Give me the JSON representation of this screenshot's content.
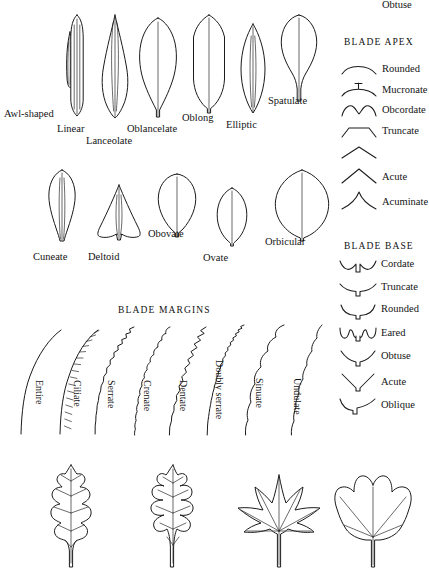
{
  "plate": {
    "title": "Leaf Morphology Plate",
    "background_color": "#ffffff",
    "ink_color": "#1b1b1b"
  },
  "blade_shapes_row1": {
    "items": [
      {
        "label": "Awl-shaped",
        "shape": "subulate"
      },
      {
        "label": "Linear",
        "shape": "linear"
      },
      {
        "label": "Lanceolate",
        "shape": "lanceolate"
      },
      {
        "label": "Oblancelate",
        "shape": "oblanceolate"
      },
      {
        "label": "Oblong",
        "shape": "oblong"
      },
      {
        "label": "Elliptic",
        "shape": "elliptic"
      },
      {
        "label": "Spatulate",
        "shape": "spatulate"
      }
    ]
  },
  "blade_shapes_row2": {
    "items": [
      {
        "label": "Cuneate",
        "shape": "cuneate"
      },
      {
        "label": "Deltoid",
        "shape": "deltoid"
      },
      {
        "label": "Obovate",
        "shape": "obovate"
      },
      {
        "label": "Ovate",
        "shape": "ovate"
      },
      {
        "label": "Orbicular",
        "shape": "orbicular"
      }
    ]
  },
  "blade_apex": {
    "heading": "BLADE APEX",
    "items": [
      {
        "label": "Rounded",
        "glyph": "apex-rounded"
      },
      {
        "label": "Mucronate",
        "glyph": "apex-mucronate"
      },
      {
        "label": "Obcordate",
        "glyph": "apex-obcordate"
      },
      {
        "label": "Truncate",
        "glyph": "apex-truncate"
      },
      {
        "label": "Obtuse",
        "glyph": "apex-obtuse"
      },
      {
        "label": "Acute",
        "glyph": "apex-acute"
      },
      {
        "label": "Acuminate",
        "glyph": "apex-acuminate"
      }
    ]
  },
  "blade_base": {
    "heading": "BLADE BASE",
    "items": [
      {
        "label": "Cordate",
        "glyph": "base-cordate"
      },
      {
        "label": "Truncate",
        "glyph": "base-truncate"
      },
      {
        "label": "Rounded",
        "glyph": "base-rounded"
      },
      {
        "label": "Eared",
        "glyph": "base-eared"
      },
      {
        "label": "Obtuse",
        "glyph": "base-obtuse"
      },
      {
        "label": "Acute",
        "glyph": "base-acute"
      },
      {
        "label": "Oblique",
        "glyph": "base-oblique"
      }
    ]
  },
  "blade_margins": {
    "heading": "BLADE MARGINS",
    "items": [
      {
        "label": "Entire",
        "margin": "entire"
      },
      {
        "label": "Ciliate",
        "margin": "ciliate"
      },
      {
        "label": "Serrate",
        "margin": "serrate"
      },
      {
        "label": "Crenate",
        "margin": "crenate"
      },
      {
        "label": "Dentate",
        "margin": "dentate"
      },
      {
        "label": "Doubly serrate",
        "margin": "doubly-serrate"
      },
      {
        "label": "Sinuate",
        "margin": "sinuate"
      },
      {
        "label": "Undulate",
        "margin": "undulate"
      }
    ]
  },
  "lobed_leaves": {
    "items": [
      {
        "shape": "pinnately-lobed-shallow"
      },
      {
        "shape": "pinnately-lobed-deep"
      },
      {
        "shape": "palmately-lobed-maple"
      },
      {
        "shape": "palmately-lobed-tulip"
      }
    ]
  }
}
